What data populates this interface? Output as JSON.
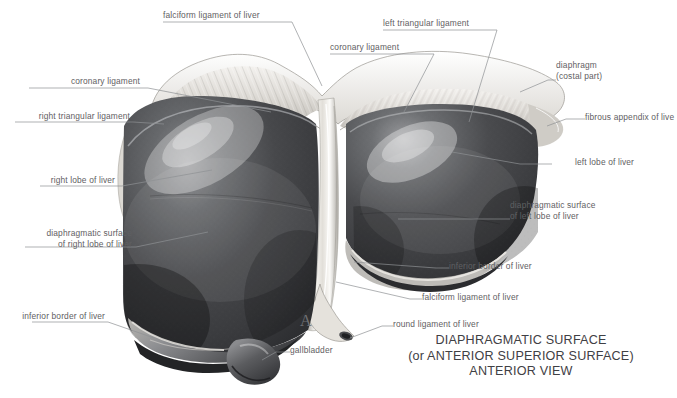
{
  "figure": {
    "kind": "anatomical-illustration",
    "subject": "liver",
    "view": "anterior",
    "background_color": "#ffffff",
    "organ_color": "#3b3b3d",
    "ligament_color": "#e9e7e2",
    "label_color": "#5f6063",
    "title_color": "#3f4044",
    "leader_color": "#8e9094",
    "figure_marker": "A"
  },
  "title": {
    "line1": "DIAPHRAGMATIC SURFACE",
    "line2": "(or ANTERIOR SUPERIOR SURFACE)",
    "line3": "ANTERIOR VIEW"
  },
  "labels": [
    {
      "id": "falciform-ligament-top",
      "text": "falciform ligament of liver",
      "align": "left",
      "x": 163,
      "y": 10
    },
    {
      "id": "left-triangular",
      "text": "left triangular ligament",
      "align": "left",
      "x": 383,
      "y": 18
    },
    {
      "id": "coronary-ligament-right",
      "text": "coronary ligament",
      "align": "left",
      "x": 330,
      "y": 42
    },
    {
      "id": "coronary-ligament-left",
      "text": "coronary ligament",
      "align": "right",
      "x": 29,
      "y": 76
    },
    {
      "id": "diaphragm",
      "text": "diaphragm",
      "align": "left",
      "x": 556,
      "y": 60
    },
    {
      "id": "diaphragm-sub",
      "text": "(costal part)",
      "align": "left",
      "x": 556,
      "y": 71
    },
    {
      "id": "right-triangular",
      "text": "right triangular ligament",
      "align": "right",
      "x": 15,
      "y": 111
    },
    {
      "id": "fibrous-appendix",
      "text": "fibrous appendix of live",
      "align": "left",
      "x": 585,
      "y": 112
    },
    {
      "id": "left-lobe",
      "text": "left lobe of liver",
      "align": "left",
      "x": 552,
      "y": 157
    },
    {
      "id": "right-lobe",
      "text": "right lobe of liver",
      "align": "right",
      "x": 40,
      "y": 175
    },
    {
      "id": "diaph-surface-left-1",
      "text": "diaphragmatic surface",
      "align": "left",
      "x": 510,
      "y": 200
    },
    {
      "id": "diaph-surface-left-2",
      "text": "of left lobe of liver",
      "align": "left",
      "x": 510,
      "y": 211
    },
    {
      "id": "diaph-surface-right-1",
      "text": "diaphragmatic surface",
      "align": "right",
      "x": 25,
      "y": 228
    },
    {
      "id": "diaph-surface-right-2",
      "text": "of right lobe of liver",
      "align": "right",
      "x": 25,
      "y": 239
    },
    {
      "id": "inferior-border-right",
      "text": "inferior border of liver",
      "align": "left",
      "x": 449,
      "y": 261
    },
    {
      "id": "falciform-ligament-bot",
      "text": "falciform ligament of liver",
      "align": "left",
      "x": 422,
      "y": 292
    },
    {
      "id": "inferior-border-left",
      "text": "inferior border of liver",
      "align": "right",
      "x": 32,
      "y": 311
    },
    {
      "id": "round-ligament",
      "text": "round ligament of liver",
      "align": "left",
      "x": 393,
      "y": 319
    },
    {
      "id": "gallbladder",
      "text": "gallbladder",
      "align": "left",
      "x": 290,
      "y": 345
    }
  ],
  "structures": [
    "right lobe of liver",
    "left lobe of liver",
    "falciform ligament of liver",
    "round ligament of liver",
    "coronary ligament",
    "right triangular ligament",
    "left triangular ligament",
    "diaphragm (costal part)",
    "fibrous appendix of liver",
    "gallbladder",
    "inferior border of liver",
    "diaphragmatic surface"
  ]
}
